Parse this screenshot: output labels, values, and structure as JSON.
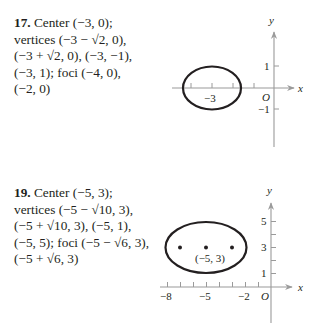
{
  "problems": [
    {
      "number": "17.",
      "lines": [
        "Center (−3, 0);",
        "vertices (−3 − √2, 0),",
        "(−3 + √2, 0), (−3, −1),",
        "(−3, 1); foci (−4, 0),",
        "(−2, 0)"
      ],
      "center_label": "Center (−3, 0);",
      "graph": {
        "x_axis_label": "x",
        "y_axis_label": "y",
        "origin_label": "O",
        "x_tick_labels": [
          "−3"
        ],
        "y_tick_labels": [
          "1",
          "−1"
        ]
      }
    },
    {
      "number": "19.",
      "lines": [
        "Center (−5, 3);",
        "vertices (−5 − √10, 3),",
        "(−5 + √10, 3), (−5, 1),",
        "(−5, 5); foci (−5 − √6, 3),",
        "(−5 + √6, 3)"
      ],
      "graph": {
        "x_axis_label": "x",
        "y_axis_label": "y",
        "origin_label": "O",
        "x_tick_labels": [
          "−8",
          "−5",
          "−2"
        ],
        "y_tick_labels": [
          "5",
          "3",
          "1"
        ],
        "point_label": "(−5, 3)"
      }
    }
  ],
  "colors": {
    "axis": "#9a9a9a",
    "curve": "#231f20",
    "text": "#231f20"
  }
}
